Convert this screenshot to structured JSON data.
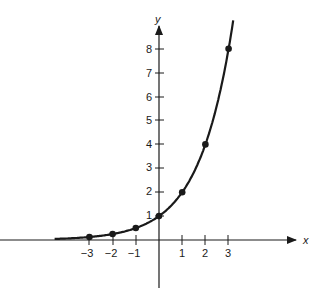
{
  "chart_data": {
    "type": "line",
    "title": "",
    "xlabel": "x",
    "ylabel": "y",
    "function": "y = 2^x",
    "x_ticks": [
      "-3",
      "-2",
      "-1",
      "1",
      "2",
      "3"
    ],
    "y_ticks": [
      "1",
      "2",
      "3",
      "4",
      "5",
      "6",
      "7",
      "8"
    ],
    "xlim": [
      -4.5,
      6.5
    ],
    "ylim": [
      -2.5,
      9
    ],
    "grid": false,
    "series": [
      {
        "name": "y = 2^x",
        "points": [
          {
            "x": -3,
            "y": 0.125
          },
          {
            "x": -2,
            "y": 0.25
          },
          {
            "x": -1,
            "y": 0.5
          },
          {
            "x": 0,
            "y": 1
          },
          {
            "x": 1,
            "y": 2
          },
          {
            "x": 2,
            "y": 4
          },
          {
            "x": 3,
            "y": 8
          }
        ]
      }
    ]
  },
  "labels": {
    "x_axis": "x",
    "y_axis": "y",
    "x_ticks": [
      "−3",
      "−2",
      "−1",
      "1",
      "2",
      "3"
    ],
    "y_ticks": [
      "1",
      "2",
      "3",
      "4",
      "5",
      "6",
      "7",
      "8"
    ]
  }
}
